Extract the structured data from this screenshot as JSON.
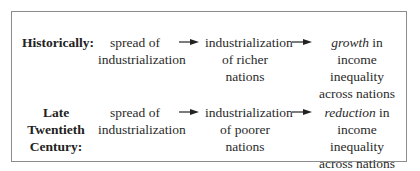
{
  "rows": [
    {
      "label": "Historically:",
      "cause": [
        "spread of",
        "industrialization"
      ],
      "effect": [
        "industrialization",
        "of richer nations"
      ],
      "result_em": "growth",
      "result_rest": " in",
      "result_lines": [
        "income inequality",
        "across nations"
      ]
    },
    {
      "label_lines": [
        "Late Twentieth",
        "Century:"
      ],
      "cause": [
        "spread of",
        "industrialization"
      ],
      "effect": [
        "industrialization",
        "of poorer nations"
      ],
      "result_em": "reduction",
      "result_rest": " in",
      "result_lines": [
        "income inequality",
        "across nations"
      ]
    }
  ],
  "icons": {
    "arrow": "right-arrow-icon"
  },
  "colors": {
    "border": "#8c8c8c",
    "text": "#2a2a2a"
  }
}
